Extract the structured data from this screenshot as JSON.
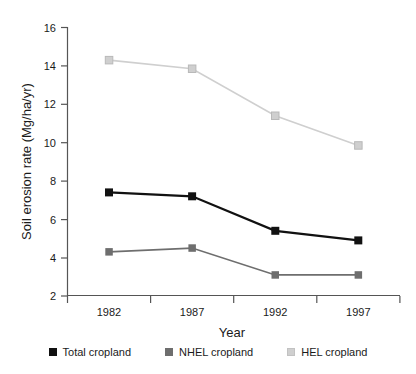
{
  "chart_data": {
    "type": "line",
    "title": "",
    "xlabel": "Year",
    "ylabel": "Soil erosion rate (Mg/ha/yr)",
    "categories": [
      "1982",
      "1987",
      "1992",
      "1997"
    ],
    "x": [
      1982,
      1987,
      1992,
      1997
    ],
    "ylim": [
      2,
      16
    ],
    "yticks": [
      2,
      4,
      6,
      8,
      10,
      12,
      14,
      16
    ],
    "ytick_labels": [
      "2",
      "4",
      "6",
      "8",
      "10",
      "12",
      "14",
      "16"
    ],
    "grid": false,
    "legend_position": "bottom",
    "series": [
      {
        "name": "Total cropland",
        "color": "#111111",
        "marker": "square",
        "values": [
          7.4,
          7.2,
          5.4,
          4.9
        ]
      },
      {
        "name": "NHEL cropland",
        "color": "#6e6e6e",
        "marker": "square",
        "values": [
          4.3,
          4.5,
          3.1,
          3.1
        ]
      },
      {
        "name": "HEL cropland",
        "color": "#cfcfcf",
        "marker": "square",
        "values": [
          14.3,
          13.85,
          11.4,
          9.85
        ]
      }
    ]
  },
  "axes": {
    "y_title": "Soil erosion rate (Mg/ha/yr)",
    "x_title": "Year",
    "y_ticks": [
      "16",
      "14",
      "12",
      "10",
      "8",
      "6",
      "4",
      "2"
    ],
    "x_ticks": [
      "1982",
      "1987",
      "1992",
      "1997"
    ]
  },
  "legend": {
    "items": [
      {
        "label": "Total cropland",
        "color": "#111111"
      },
      {
        "label": "NHEL cropland",
        "color": "#6e6e6e"
      },
      {
        "label": "HEL cropland",
        "color": "#cfcfcf"
      }
    ]
  },
  "colors": {
    "total_cropland": "#111111",
    "nhel_cropland": "#6e6e6e",
    "hel_cropland": "#cfcfcf",
    "axis": "#555555",
    "background": "#ffffff"
  }
}
